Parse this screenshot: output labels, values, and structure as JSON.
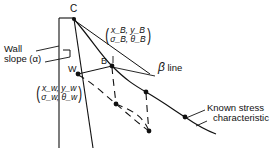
{
  "figure": {
    "type": "engineering-diagram",
    "background": "#ffffff",
    "stroke_color": "#111111"
  },
  "points": {
    "c": {
      "label": "C",
      "x": 74,
      "y": 18
    },
    "w": {
      "label": "W",
      "x": 78,
      "y": 74
    },
    "b": {
      "label": "B",
      "x": 112,
      "y": 66
    }
  },
  "labels": {
    "wall_slope": {
      "line1": "Wall",
      "line2": "slope (α)"
    },
    "beta_line": {
      "symbol": "β",
      "text": "line"
    },
    "known_stress": {
      "line1": "Known stress",
      "line2": "characteristic"
    },
    "point_b_state": {
      "top": "(xₘ, yₘ)",
      "top_main": "x",
      "top_sub": "B",
      "bottom_main": "σ",
      "bottom_sub": "B",
      "numerator": "x_B, y_B",
      "denominator": "σ_B, θ_B"
    },
    "point_w_state": {
      "numerator": "x_w, y_w",
      "denominator": "σ_w, θ_w"
    }
  },
  "geometry": {
    "wall_left_x": 59,
    "wall_top_y": 18,
    "wall_bottom_y": 148,
    "known_characteristic_nodes": [
      {
        "x": 74,
        "y": 18
      },
      {
        "x": 112,
        "y": 66
      },
      {
        "x": 146,
        "y": 92
      },
      {
        "x": 185,
        "y": 117
      },
      {
        "x": 215,
        "y": 133
      }
    ],
    "dashed_nodes": [
      {
        "x": 78,
        "y": 74
      },
      {
        "x": 116,
        "y": 104
      },
      {
        "x": 148,
        "y": 130
      }
    ],
    "right_angle_marker": {
      "x": 63,
      "y": 52,
      "size": 7
    }
  }
}
